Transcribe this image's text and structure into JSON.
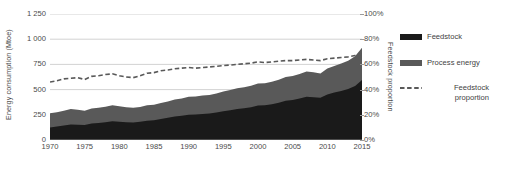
{
  "chart_data": {
    "type": "area",
    "title": "",
    "xlabel": "",
    "ylabel": "Energy consumption (Mtoe)",
    "y2label": "Feedstock proportion",
    "grid": true,
    "legend_position": "right",
    "xlim": [
      1970,
      2015
    ],
    "ylim": [
      0,
      1250
    ],
    "y2lim": [
      0,
      100
    ],
    "x_ticks": [
      "1970",
      "1975",
      "1980",
      "1985",
      "1990",
      "1995",
      "2000",
      "2005",
      "2010",
      "2015"
    ],
    "y_ticks": [
      "0",
      "250",
      "500",
      "750",
      "1 000",
      "1 250"
    ],
    "y2_ticks": [
      "0%",
      "20%",
      "40%",
      "60%",
      "80%",
      "100%"
    ],
    "x": [
      1970,
      1971,
      1972,
      1973,
      1974,
      1975,
      1976,
      1977,
      1978,
      1979,
      1980,
      1981,
      1982,
      1983,
      1984,
      1985,
      1986,
      1987,
      1988,
      1989,
      1990,
      1991,
      1992,
      1993,
      1994,
      1995,
      1996,
      1997,
      1998,
      1999,
      2000,
      2001,
      2002,
      2003,
      2004,
      2005,
      2006,
      2007,
      2008,
      2009,
      2010,
      2011,
      2012,
      2013,
      2014,
      2015
    ],
    "series": [
      {
        "name": "Feedstock",
        "color": "#1a1a1a",
        "stacked": true,
        "values": [
          125,
          133,
          143,
          155,
          152,
          148,
          163,
          168,
          176,
          185,
          180,
          176,
          174,
          180,
          192,
          196,
          209,
          220,
          233,
          241,
          250,
          252,
          258,
          262,
          272,
          285,
          296,
          308,
          316,
          326,
          342,
          344,
          355,
          370,
          390,
          398,
          412,
          428,
          424,
          418,
          452,
          470,
          487,
          505,
          535,
          595
        ]
      },
      {
        "name": "Process energy",
        "color": "#595959",
        "stacked": true,
        "values": [
          140,
          142,
          147,
          152,
          148,
          143,
          150,
          152,
          155,
          160,
          155,
          150,
          147,
          148,
          152,
          153,
          158,
          162,
          168,
          170,
          178,
          180,
          183,
          185,
          190,
          196,
          200,
          205,
          208,
          212,
          218,
          218,
          222,
          228,
          235,
          238,
          244,
          252,
          248,
          242,
          258,
          265,
          272,
          280,
          295,
          320
        ]
      }
    ],
    "line_series": {
      "name": "Feedstock proportion",
      "color": "#595959",
      "style": "dashed",
      "axis": "secondary",
      "unit": "%",
      "values": [
        46.0,
        47.0,
        48.5,
        49.0,
        49.5,
        48.0,
        50.5,
        51.0,
        52.0,
        52.5,
        51.0,
        50.0,
        49.5,
        51.0,
        53.0,
        53.5,
        55.0,
        55.5,
        56.5,
        57.0,
        57.5,
        57.0,
        57.5,
        58.0,
        58.5,
        59.0,
        59.5,
        60.0,
        60.5,
        61.0,
        62.0,
        61.5,
        62.0,
        62.5,
        63.0,
        63.0,
        63.5,
        64.0,
        63.5,
        63.0,
        64.5,
        65.0,
        65.5,
        66.0,
        67.0,
        68.0
      ]
    }
  },
  "legend": {
    "items": [
      {
        "label": "Feedstock",
        "label_line2": "",
        "marker": "swatch",
        "color": "#1a1a1a"
      },
      {
        "label": "Process energy",
        "label_line2": "",
        "marker": "swatch",
        "color": "#595959"
      },
      {
        "label": "Feedstock",
        "label_line2": "proportion",
        "marker": "dashed-line",
        "color": "#595959"
      }
    ]
  }
}
